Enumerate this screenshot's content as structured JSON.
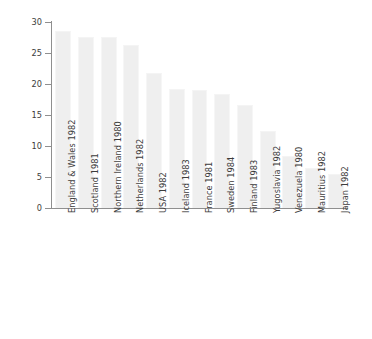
{
  "chart_data": {
    "type": "bar",
    "title": "",
    "xlabel": "",
    "ylabel": "Mortality rate/100 000 women",
    "ylim": [
      0,
      30
    ],
    "yticks": [
      0,
      5,
      10,
      15,
      20,
      25,
      30
    ],
    "grid": false,
    "legend": null,
    "bar_color": "#efefef",
    "axis_color": "#8f8f8f",
    "text_color": "#3c3c3c",
    "categories": [
      "England & Wales 1982",
      "Scotland 1981",
      "Northern Ireland 1980",
      "Netherlands 1982",
      "USA 1982",
      "Iceland 1983",
      "France 1981",
      "Sweden 1984",
      "Finland 1983",
      "Yugoslavia 1982",
      "Venezuela 1980",
      "Mauritius 1982",
      "Japan 1982"
    ],
    "values": [
      28.6,
      27.6,
      27.6,
      26.3,
      21.7,
      19.2,
      19.1,
      18.4,
      16.6,
      12.5,
      8.4,
      6.4,
      5.5
    ]
  }
}
